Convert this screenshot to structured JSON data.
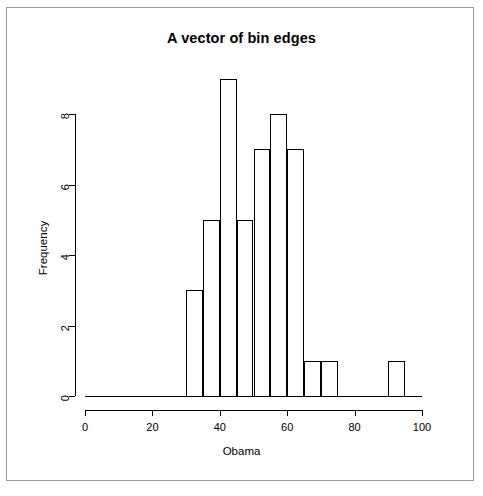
{
  "chart_data": {
    "type": "bar",
    "title": "A vector of bin edges",
    "xlabel": "Obama",
    "ylabel": "Frequency",
    "xlim": [
      0,
      100
    ],
    "ylim": [
      0,
      9
    ],
    "grid": false,
    "legend": null,
    "bin_width": 5,
    "bin_edges": [
      30,
      35,
      40,
      45,
      50,
      55,
      60,
      65,
      70,
      75,
      90,
      95
    ],
    "categories": [
      "30-35",
      "35-40",
      "40-45",
      "45-50",
      "50-55",
      "55-60",
      "60-65",
      "65-70",
      "70-75",
      "90-95"
    ],
    "values": [
      3,
      5,
      9,
      5,
      7,
      8,
      7,
      1,
      1,
      1
    ],
    "bars": [
      {
        "x0": 30,
        "x1": 35,
        "value": 3
      },
      {
        "x0": 35,
        "x1": 40,
        "value": 5
      },
      {
        "x0": 40,
        "x1": 45,
        "value": 9
      },
      {
        "x0": 45,
        "x1": 50,
        "value": 5
      },
      {
        "x0": 50,
        "x1": 55,
        "value": 7
      },
      {
        "x0": 55,
        "x1": 60,
        "value": 8
      },
      {
        "x0": 60,
        "x1": 65,
        "value": 7
      },
      {
        "x0": 65,
        "x1": 70,
        "value": 1
      },
      {
        "x0": 70,
        "x1": 75,
        "value": 1
      },
      {
        "x0": 90,
        "x1": 95,
        "value": 1
      }
    ],
    "xticks": [
      0,
      20,
      40,
      60,
      80,
      100
    ],
    "xtick_labels": [
      "0",
      "20",
      "40",
      "60",
      "80",
      "100"
    ],
    "yticks": [
      0,
      2,
      4,
      6,
      8
    ],
    "ytick_labels": [
      "0",
      "2",
      "4",
      "6",
      "8"
    ],
    "colors": {
      "background": "#ffffff",
      "axis": "#000000",
      "bar_border": "#000000",
      "bar_fill": "transparent",
      "frame": "#9a9a9a"
    }
  }
}
